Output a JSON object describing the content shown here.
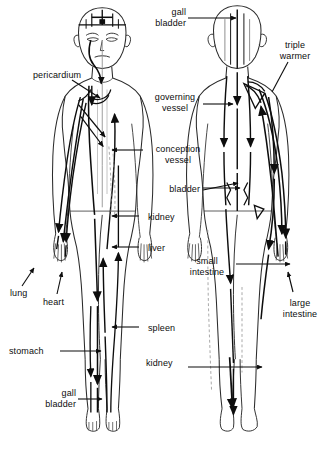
{
  "figure": {
    "views": [
      "anterior",
      "posterior"
    ],
    "colors": {
      "background": "#ffffff",
      "ink": "#0d0d0d",
      "meridian": "#111111",
      "body_outline": "#2b2b2b",
      "faint_line": "#9a9a9a"
    }
  },
  "labels": [
    {
      "id": "gall-bladder-head",
      "text": "gall\nbladder",
      "align": "right",
      "x": 186,
      "y": 7
    },
    {
      "id": "triple-warmer",
      "text": "triple\nwarmer",
      "align": "center",
      "x": 295,
      "y": 40
    },
    {
      "id": "pericardium",
      "text": "pericardium",
      "align": "left",
      "x": 33,
      "y": 70
    },
    {
      "id": "governing-vessel",
      "text": "governing\nvessel",
      "align": "center",
      "x": 175,
      "y": 92
    },
    {
      "id": "conception-vessel",
      "text": "conception\nvessel",
      "align": "center",
      "x": 182,
      "y": 144
    },
    {
      "id": "bladder",
      "text": "bladder",
      "align": "right",
      "x": 200,
      "y": 184
    },
    {
      "id": "kidney-upper",
      "text": "kidney",
      "align": "right",
      "x": 182,
      "y": 212
    },
    {
      "id": "liver",
      "text": "liver",
      "align": "right",
      "x": 175,
      "y": 243
    },
    {
      "id": "small-intestine",
      "text": "small\nintestine",
      "align": "center",
      "x": 209,
      "y": 256
    },
    {
      "id": "large-intestine",
      "text": "large\nintestine",
      "align": "center",
      "x": 300,
      "y": 298
    },
    {
      "id": "lung",
      "text": "lung",
      "align": "left",
      "x": 12,
      "y": 288
    },
    {
      "id": "heart",
      "text": "heart",
      "align": "left",
      "x": 45,
      "y": 297
    },
    {
      "id": "spleen",
      "text": "spleen",
      "align": "right",
      "x": 182,
      "y": 323
    },
    {
      "id": "stomach",
      "text": "stomach",
      "align": "left",
      "x": 9,
      "y": 346
    },
    {
      "id": "kidney-lower",
      "text": "kidney",
      "align": "right",
      "x": 180,
      "y": 358
    },
    {
      "id": "gall-bladder-leg",
      "text": "gall\nbladder",
      "align": "right",
      "x": 74,
      "y": 388
    }
  ],
  "meridians": [
    "gall bladder",
    "triple warmer",
    "pericardium",
    "governing vessel",
    "conception vessel",
    "bladder",
    "kidney",
    "liver",
    "small intestine",
    "large intestine",
    "lung",
    "heart",
    "spleen",
    "stomach"
  ]
}
